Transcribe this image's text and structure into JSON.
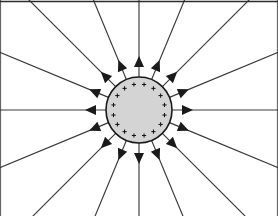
{
  "figure": {
    "width": 278,
    "height": 216,
    "background_color": "#ffffff"
  },
  "frame": {
    "name": "figure-border",
    "top_border_color": "#2b2b2b",
    "side_border_color": "#9a9a9a",
    "top_border_width": 1.6,
    "side_border_width": 0.8,
    "has_top": true,
    "has_left": true,
    "has_right": true,
    "has_bottom": false
  },
  "sphere": {
    "label": "positively charged sphere",
    "center_x": 139,
    "center_y": 110,
    "radius": 33,
    "fill_color": "#d4d4d4",
    "stroke_color": "#1a1a1a",
    "stroke_width": 1.6,
    "charge_sign": "+",
    "charge_count": 16,
    "charge_ring_radius": 26,
    "charge_glyph_size": 4.2
  },
  "field_lines": {
    "label": "radial electric field lines",
    "count": 16,
    "angle_step_degrees": 22.5,
    "direction": "outward",
    "stroke_color": "#3a3a3a",
    "stroke_width": 1.15,
    "inner_radius": 33,
    "arrow_radius": 54,
    "arrow_length": 11,
    "arrow_half_width": 5,
    "arrow_color": "#1a1a1a",
    "angles_degrees": [
      0,
      22.5,
      45,
      67.5,
      90,
      112.5,
      135,
      157.5,
      180,
      202.5,
      225,
      247.5,
      270,
      292.5,
      315,
      337.5
    ]
  }
}
